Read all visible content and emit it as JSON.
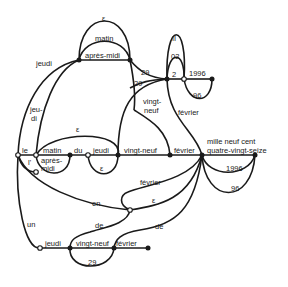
{
  "diagram": {
    "type": "finite-state automaton (French date expressions)",
    "labels": {
      "eps_top": "ε",
      "matin_top": "matin",
      "apres_midi_top": "après-midi",
      "jeudi_top": "jeudi",
      "jeu_di": "jeu-",
      "jeu_di2": "di",
      "n29a": "29",
      "n29b": "29",
      "vingt": "vingt-",
      "neuf": "neuf",
      "II": "II",
      "n02": "02",
      "n2": "2",
      "n1996_top": "1996",
      "n96_top": "96",
      "fevrier_mid": "février",
      "le": "le",
      "l_apos": "l'",
      "matin_mid": "matin",
      "apres": "après-",
      "midi": "midi",
      "eps_mid": "ε",
      "du": "du",
      "jeudi_mid": "jeudi",
      "eps_small": "ε",
      "vingt_neuf_mid": "vingt-neuf",
      "fevrier_main": "février",
      "mille1": "mille neuf cent",
      "mille2": "quatre-vingt-seize",
      "n1996_right": "1996",
      "n96_right": "96",
      "fevrier_low": "février",
      "en": "en",
      "eps_low": "ε",
      "de1": "de",
      "de2": "de",
      "un": "un",
      "jeudi_bot": "jeudi",
      "vingt_neuf_bot": "vingt-neuf",
      "fevrier_bot": "février",
      "n29_bot": "29"
    }
  }
}
